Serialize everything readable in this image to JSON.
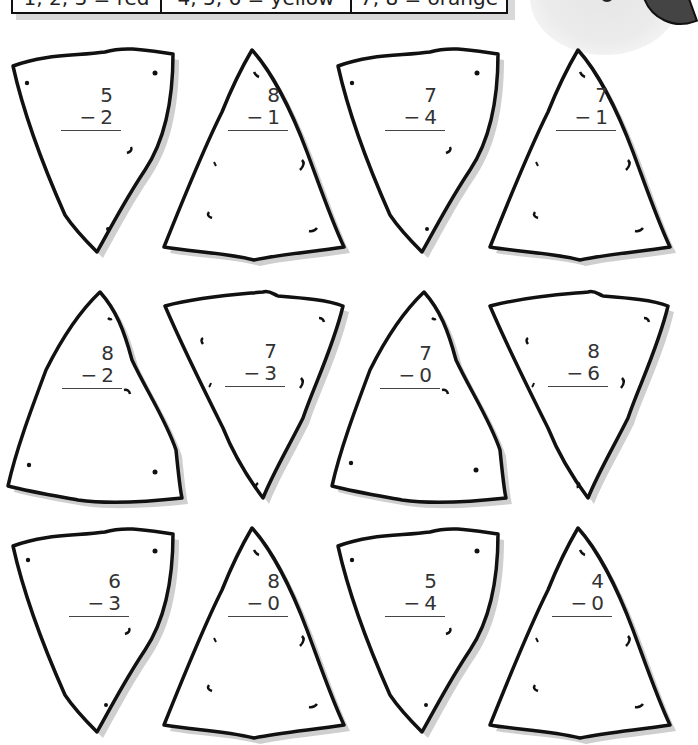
{
  "color_key": [
    {
      "label": "1, 2, 3 = red",
      "numbers": [
        1,
        2,
        3
      ],
      "color": "red"
    },
    {
      "label": "4, 5, 6 = yellow",
      "numbers": [
        4,
        5,
        6
      ],
      "color": "yellow"
    },
    {
      "label": "7, 8 = orange",
      "numbers": [
        7,
        8
      ],
      "color": "orange"
    }
  ],
  "problems": [
    {
      "top": "5",
      "bottom": "2",
      "operator": "−",
      "shape": "down"
    },
    {
      "top": "8",
      "bottom": "1",
      "operator": "−",
      "shape": "up"
    },
    {
      "top": "7",
      "bottom": "4",
      "operator": "−",
      "shape": "down"
    },
    {
      "top": "7",
      "bottom": "1",
      "operator": "−",
      "shape": "up"
    },
    {
      "top": "8",
      "bottom": "2",
      "operator": "−",
      "shape": "up"
    },
    {
      "top": "7",
      "bottom": "3",
      "operator": "−",
      "shape": "down"
    },
    {
      "top": "7",
      "bottom": "0",
      "operator": "−",
      "shape": "up"
    },
    {
      "top": "8",
      "bottom": "6",
      "operator": "−",
      "shape": "down"
    },
    {
      "top": "6",
      "bottom": "3",
      "operator": "−",
      "shape": "down"
    },
    {
      "top": "8",
      "bottom": "0",
      "operator": "−",
      "shape": "up"
    },
    {
      "top": "5",
      "bottom": "4",
      "operator": "−",
      "shape": "down"
    },
    {
      "top": "4",
      "bottom": "0",
      "operator": "−",
      "shape": "up"
    }
  ]
}
